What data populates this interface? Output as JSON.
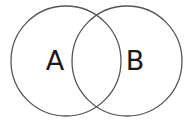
{
  "diagram": {
    "type": "venn",
    "sets": [
      {
        "label": "A",
        "cx": 66,
        "cy": 61,
        "r": 55
      },
      {
        "label": "B",
        "cx": 127,
        "cy": 61,
        "r": 55
      }
    ],
    "stroke_color": "#555555",
    "background": "#ffffff"
  }
}
